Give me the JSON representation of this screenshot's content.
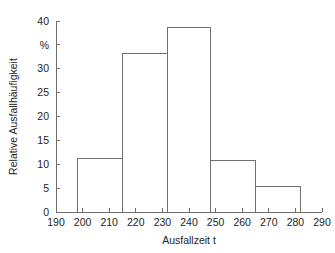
{
  "chart_data": {
    "type": "bar",
    "title": "",
    "subtitle": "",
    "xlabel": "Ausfallzeit t",
    "ylabel": "Relative Ausfallhäufigkeit",
    "yunit": "%",
    "xlim": [
      190,
      290
    ],
    "ylim": [
      0,
      40
    ],
    "grid": false,
    "legend": null,
    "x_ticks": [
      190,
      200,
      210,
      220,
      230,
      240,
      250,
      260,
      270,
      280,
      290
    ],
    "x_tick_labels": [
      "190",
      "200",
      "210",
      "220",
      "230",
      "240",
      "250",
      "260",
      "270",
      "280",
      "290"
    ],
    "y_ticks": [
      0,
      5,
      10,
      15,
      20,
      25,
      30,
      35,
      40
    ],
    "y_tick_labels": [
      "0",
      "5",
      "10",
      "15",
      "20",
      "25",
      "30",
      "%",
      "40"
    ],
    "bin_edges": [
      198,
      215,
      232,
      248,
      265,
      282
    ],
    "categories": [
      "198-215",
      "215-232",
      "232-248",
      "248-265",
      "265-282"
    ],
    "values": [
      11.1,
      33.2,
      38.7,
      10.8,
      5.3
    ],
    "bars": [
      {
        "x0": 198,
        "x1": 215,
        "height": 11.1
      },
      {
        "x0": 215,
        "x1": 232,
        "height": 33.2
      },
      {
        "x0": 232,
        "x1": 248,
        "height": 38.7
      },
      {
        "x0": 248,
        "x1": 265,
        "height": 10.8
      },
      {
        "x0": 265,
        "x1": 282,
        "height": 5.3
      }
    ],
    "colors": {
      "bar_fill": "#ffffff",
      "bar_stroke": "#707070",
      "axis": "#6e6e6e",
      "text": "#242424",
      "background": "#ffffff"
    }
  }
}
